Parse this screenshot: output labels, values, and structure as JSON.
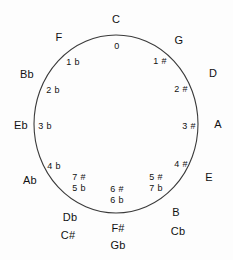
{
  "diagram": {
    "stroke_color": "#3a3a3a",
    "text_color": "#111111",
    "background_color": "#fdfdfd",
    "outer_keys": [
      {
        "name": "key-c",
        "label": "C",
        "x": 116,
        "y": 19
      },
      {
        "name": "key-g",
        "label": "G",
        "x": 179,
        "y": 40
      },
      {
        "name": "key-d",
        "label": "D",
        "x": 213,
        "y": 73
      },
      {
        "name": "key-a",
        "label": "A",
        "x": 218,
        "y": 124
      },
      {
        "name": "key-e",
        "label": "E",
        "x": 209,
        "y": 177
      },
      {
        "name": "key-b",
        "label": "B",
        "x": 176,
        "y": 212
      },
      {
        "name": "key-cb",
        "label": "Cb",
        "x": 178,
        "y": 231
      },
      {
        "name": "key-fsharp",
        "label": "F#",
        "x": 118,
        "y": 228
      },
      {
        "name": "key-gb",
        "label": "Gb",
        "x": 118,
        "y": 245
      },
      {
        "name": "key-db",
        "label": "Db",
        "x": 70,
        "y": 217
      },
      {
        "name": "key-csharp",
        "label": "C#",
        "x": 68,
        "y": 235
      },
      {
        "name": "key-ab",
        "label": "Ab",
        "x": 30,
        "y": 180
      },
      {
        "name": "key-eb",
        "label": "Eb",
        "x": 21,
        "y": 125
      },
      {
        "name": "key-bb",
        "label": "Bb",
        "x": 27,
        "y": 74
      },
      {
        "name": "key-f",
        "label": "F",
        "x": 59,
        "y": 37
      }
    ],
    "inner_accidentals": [
      {
        "name": "acc-0",
        "label": "0",
        "x": 117,
        "y": 46
      },
      {
        "name": "acc-1-sharp",
        "label": "1 #",
        "x": 160,
        "y": 61
      },
      {
        "name": "acc-2-sharp",
        "label": "2 #",
        "x": 181,
        "y": 89
      },
      {
        "name": "acc-3-sharp",
        "label": "3 #",
        "x": 189,
        "y": 126
      },
      {
        "name": "acc-4-sharp",
        "label": "4 #",
        "x": 181,
        "y": 164
      },
      {
        "name": "acc-1-flat",
        "label": "1 b",
        "x": 73,
        "y": 62
      },
      {
        "name": "acc-2-flat",
        "label": "2 b",
        "x": 53,
        "y": 90
      },
      {
        "name": "acc-3-flat",
        "label": "3 b",
        "x": 45,
        "y": 126
      },
      {
        "name": "acc-4-flat",
        "label": "4 b",
        "x": 54,
        "y": 166
      }
    ],
    "inner_stacks": [
      {
        "name": "acc-stack-sharp7-flat5",
        "x": 79,
        "y": 183,
        "top": "7 #",
        "bottom": "5 b"
      },
      {
        "name": "acc-stack-sharp6-flat6",
        "x": 117,
        "y": 195,
        "top": "6 #",
        "bottom": "6 b"
      },
      {
        "name": "acc-stack-sharp5-flat7",
        "x": 156,
        "y": 183,
        "top": "5 #",
        "bottom": "7 b"
      }
    ],
    "circle": {
      "cx": 116,
      "cy": 124,
      "rx": 82,
      "ry": 89
    }
  }
}
